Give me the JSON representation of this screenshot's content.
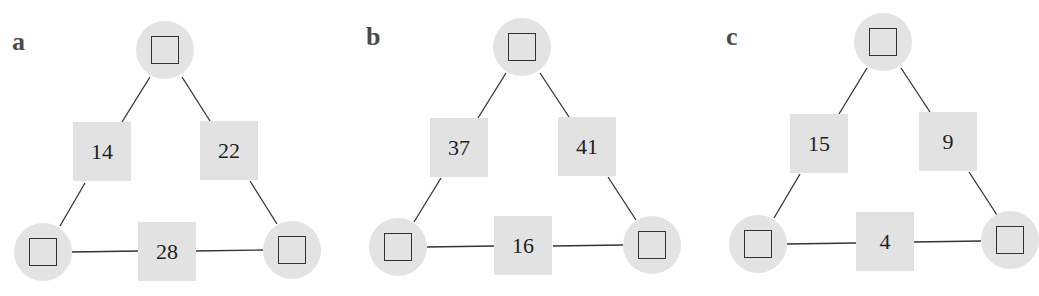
{
  "puzzles": [
    {
      "label": "a",
      "top": "",
      "bottom_left": "",
      "bottom_right": "",
      "left_edge": "14",
      "right_edge": "22",
      "bottom_edge": "28"
    },
    {
      "label": "b",
      "top": "",
      "bottom_left": "",
      "bottom_right": "",
      "left_edge": "37",
      "right_edge": "41",
      "bottom_edge": "16"
    },
    {
      "label": "c",
      "top": "",
      "bottom_left": "",
      "bottom_right": "",
      "left_edge": "15",
      "right_edge": "9",
      "bottom_edge": "4"
    }
  ],
  "colors": {
    "node_fill": "#e3e3e3",
    "box_fill": "#e2e2e2",
    "line": "#333333"
  }
}
